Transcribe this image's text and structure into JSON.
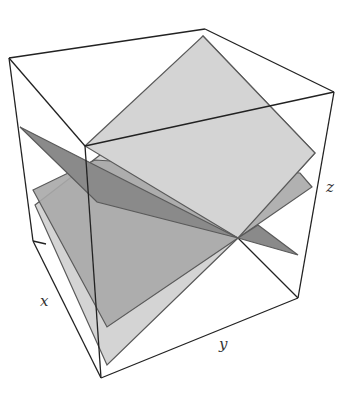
{
  "figure": {
    "type": "3d-box-plot-of-planes",
    "axis_labels": {
      "x": "x",
      "y": "y",
      "z": "z"
    },
    "colors": {
      "background": "#ffffff",
      "box_edge": "#222222",
      "plane_light": "#d4d4d4",
      "plane_medium": "#a9a9a9",
      "plane_dark": "#8a8a8a",
      "plane_edge": "#5a5a5a"
    }
  },
  "box": {
    "corners": {
      "top_left": [
        9,
        58
      ],
      "top_back": [
        205,
        29
      ],
      "top_right": [
        334,
        92
      ],
      "top_front": [
        85,
        146
      ],
      "bottom_left": [
        33,
        241
      ],
      "bottom_back": [
        238,
        238
      ],
      "bottom_right": [
        298,
        298
      ],
      "bottom_front": [
        101,
        378
      ]
    }
  },
  "planes": [
    {
      "name": "light-plane",
      "shade": "light",
      "points": [
        [
          203,
          36
        ],
        [
          315,
          153
        ],
        [
          238,
          238
        ],
        [
          107,
          365
        ],
        [
          35,
          205
        ]
      ]
    },
    {
      "name": "medium-plane",
      "shade": "medium",
      "points": [
        [
          33,
          190
        ],
        [
          95,
          160
        ],
        [
          312,
          175
        ],
        [
          300,
          190
        ],
        [
          107,
          327
        ]
      ]
    },
    {
      "name": "dark-plane",
      "shade": "dark",
      "points": [
        [
          20,
          127
        ],
        [
          238,
          238
        ],
        [
          298,
          255
        ],
        [
          238,
          238
        ],
        [
          97,
          202
        ]
      ]
    }
  ]
}
